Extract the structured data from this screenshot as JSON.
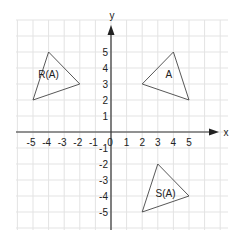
{
  "diagram": {
    "title": "",
    "axes": {
      "x_label": "x",
      "y_label": "y",
      "x_ticks": [
        "-5",
        "-4",
        "-3",
        "-2",
        "-1",
        "0",
        "1",
        "2",
        "3",
        "4",
        "5"
      ],
      "y_ticks": [
        "5",
        "4",
        "3",
        "2",
        "1",
        "-1",
        "-2",
        "-3",
        "-4",
        "-5"
      ],
      "range": {
        "x": [
          -6,
          7
        ],
        "y": [
          -6,
          7
        ]
      }
    },
    "shapes": [
      {
        "label": "A",
        "vertices": [
          [
            2,
            3
          ],
          [
            4,
            5
          ],
          [
            5,
            2
          ]
        ],
        "label_pos": [
          3.7,
          3.6
        ]
      },
      {
        "label": "R(A)",
        "vertices": [
          [
            -5,
            2
          ],
          [
            -4,
            5
          ],
          [
            -2,
            3
          ]
        ],
        "label_pos": [
          -4.0,
          3.6
        ]
      },
      {
        "label": "S(A)",
        "vertices": [
          [
            2,
            -5
          ],
          [
            3,
            -2
          ],
          [
            5,
            -4
          ]
        ],
        "label_pos": [
          3.5,
          -3.8
        ]
      }
    ],
    "colors": {
      "grid": "#e3e3e3",
      "axis": "#333333",
      "shape": "#444444"
    }
  }
}
